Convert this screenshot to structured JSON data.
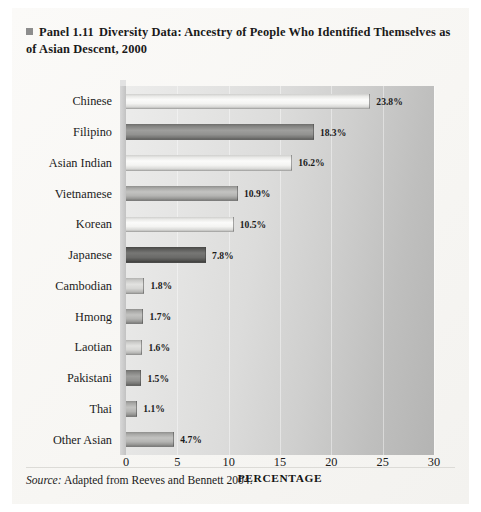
{
  "panel": {
    "bullet_icon": "square-bullet-icon",
    "panel_number": "Panel 1.11",
    "title": "Diversity Data: Ancestry of People Who Identified Themselves as of Asian Descent, 2000",
    "source_prefix": "Source:",
    "source_text": " Adapted from Reeves and Bennett 2004."
  },
  "chart_data": {
    "type": "bar",
    "orientation": "horizontal",
    "categories": [
      "Chinese",
      "Filipino",
      "Asian Indian",
      "Vietnamese",
      "Korean",
      "Japanese",
      "Cambodian",
      "Hmong",
      "Laotian",
      "Pakistani",
      "Thai",
      "Other Asian"
    ],
    "values": [
      23.8,
      18.3,
      16.2,
      10.9,
      10.5,
      7.8,
      1.8,
      1.7,
      1.6,
      1.5,
      1.1,
      4.7
    ],
    "value_labels": [
      "23.8%",
      "18.3%",
      "16.2%",
      "10.9%",
      "10.5%",
      "7.8%",
      "1.8%",
      "1.7%",
      "1.6%",
      "1.5%",
      "1.1%",
      "4.7%"
    ],
    "bar_styles": [
      "light",
      "middark",
      "light",
      "mid",
      "light",
      "dark",
      "midlight",
      "mid",
      "midlight",
      "middark",
      "mid",
      "mid"
    ],
    "xlabel": "PERCENTAGE",
    "ylabel": "",
    "xlim": [
      0,
      30
    ],
    "xticks": [
      0,
      5,
      10,
      15,
      20,
      25,
      30
    ],
    "xtick_labels": [
      "0",
      "5",
      "10",
      "15",
      "20",
      "25",
      "30"
    ],
    "grid": true,
    "grid_axis": "x",
    "legend": null,
    "series_name": "Percentage of Asian-descent population"
  }
}
